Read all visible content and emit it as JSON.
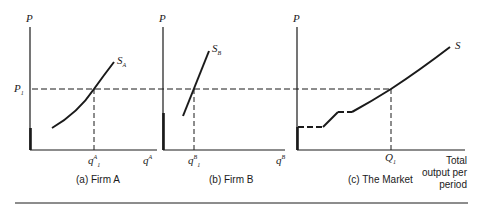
{
  "figure": {
    "panels": [
      {
        "id": "a",
        "caption": "(a) Firm A",
        "y_axis_label": "P",
        "x_axis_label": "q",
        "x_axis_sup": "A",
        "price_label": "P",
        "price_sub": "1",
        "qty_label": "q",
        "qty_sup": "A",
        "qty_sub": "1",
        "curve_label": "S",
        "curve_sub": "A"
      },
      {
        "id": "b",
        "caption": "(b) Firm B",
        "y_axis_label": "P",
        "x_axis_label": "q",
        "x_axis_sup": "B",
        "qty_label": "q",
        "qty_sup": "B",
        "qty_sub": "1",
        "curve_label": "S",
        "curve_sub": "B"
      },
      {
        "id": "c",
        "caption": "(c) The Market",
        "y_axis_label": "P",
        "x_axis_label_lines": [
          "Total",
          "output per",
          "period"
        ],
        "qty_label": "Q",
        "qty_sub": "1",
        "curve_label": "S"
      }
    ],
    "colors": {
      "ink": "#1a1a1a",
      "background": "#ffffff"
    }
  }
}
